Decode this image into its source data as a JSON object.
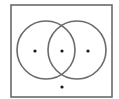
{
  "diagram": {
    "type": "venn",
    "colors": {
      "background": "#ffffff",
      "stroke": "#6a6a6a",
      "dot": "#1a1a1a"
    },
    "universe": {
      "x": 11,
      "y": 5,
      "width": 101,
      "height": 92
    },
    "sets": [
      {
        "name": "left-set",
        "cx": 46,
        "cy": 50,
        "r": 29
      },
      {
        "name": "right-set",
        "cx": 77,
        "cy": 50,
        "r": 29
      }
    ],
    "points": [
      {
        "region": "left-only",
        "cx": 35,
        "cy": 51
      },
      {
        "region": "intersection",
        "cx": 62,
        "cy": 51
      },
      {
        "region": "right-only",
        "cx": 88,
        "cy": 51
      },
      {
        "region": "outside-both",
        "cx": 62,
        "cy": 87
      }
    ]
  }
}
